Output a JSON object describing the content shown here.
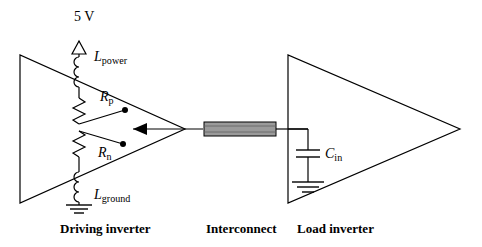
{
  "figure": {
    "title_none": "",
    "supply_label": "5 V",
    "captions": [
      {
        "id": "driving-inverter",
        "text": "Driving inverter",
        "x": 86,
        "y": 228
      },
      {
        "id": "interconnect",
        "text": "Interconnect",
        "x": 207,
        "y": 228
      },
      {
        "id": "load-inverter",
        "text": "Load inverter",
        "x": 296,
        "y": 228
      }
    ],
    "components": [
      {
        "id": "supply-voltage",
        "label": "5 V",
        "x": 76,
        "y": 17
      },
      {
        "id": "inductor-power",
        "label": "L",
        "subscript": "power",
        "x": 94,
        "y": 58
      },
      {
        "id": "resistor-p",
        "label": "R",
        "subscript": "p",
        "x": 102,
        "y": 98
      },
      {
        "id": "resistor-n",
        "label": "R",
        "subscript": "n",
        "x": 100,
        "y": 154
      },
      {
        "id": "inductor-ground",
        "label": "L",
        "subscript": "ground",
        "x": 94,
        "y": 196
      },
      {
        "id": "capacitor-in",
        "label": "C",
        "subscript": "in",
        "x": 325,
        "y": 155
      }
    ],
    "colors": {
      "ink": "#000000",
      "interconnect_fill": "#9a9a9a",
      "background": "#ffffff"
    }
  }
}
